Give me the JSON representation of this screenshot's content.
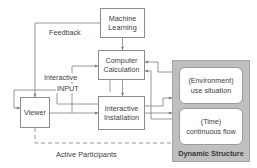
{
  "diagram": {
    "colors": {
      "panel_fill": "#bfbfbf",
      "box_border": "#8c8c8c",
      "text": "#3d3d3d",
      "wire": "#8c8c8c",
      "dashed_wire": "#8c8c8c"
    },
    "nodes": [
      {
        "id": "machine-learning",
        "lines": [
          "Machine",
          "Learning"
        ]
      },
      {
        "id": "computer-calculation",
        "lines": [
          "Computer",
          "Calculation"
        ]
      },
      {
        "id": "interactive-installation",
        "lines": [
          "Interactive",
          "Installation"
        ]
      },
      {
        "id": "viewer",
        "lines": [
          "Viewer"
        ]
      }
    ],
    "panel": {
      "caption": "Dynamic Structure",
      "nodes": [
        {
          "id": "environment",
          "lines": [
            "(Environment)",
            "use situation"
          ]
        },
        {
          "id": "time",
          "lines": [
            "(Time)",
            "continuous flow"
          ]
        }
      ]
    },
    "edge_labels": [
      {
        "id": "feedback",
        "text": "Feedback"
      },
      {
        "id": "interactive",
        "text": "Interactive"
      },
      {
        "id": "input",
        "text": "INPUT"
      }
    ],
    "flow_labels": [
      {
        "id": "active-participants",
        "text": "Active Participants"
      }
    ]
  }
}
